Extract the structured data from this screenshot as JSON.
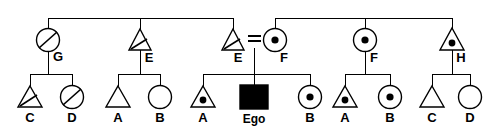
{
  "diagram": {
    "type": "pedigree",
    "width": 498,
    "height": 126,
    "colors": {
      "background": "#ffffff",
      "stroke": "#000000",
      "affected_fill": "#000000",
      "unaffected_fill": "#ffffff"
    },
    "legend_semantics": {
      "triangle": "male",
      "circle": "female",
      "square": "proband / ego",
      "center_dot": "carrier",
      "diagonal_slash": "deceased",
      "filled": "affected",
      "equals_sign": "mating / union"
    }
  },
  "generations": {
    "generation_1": {
      "name": "parental-generation",
      "sibships": [
        {
          "name": "sibship-left",
          "bar_y": 18,
          "bar_x_start": 48,
          "bar_x_end": 233,
          "members": [
            {
              "id": "g1-g",
              "label": "G",
              "shape": "circle",
              "sex": "female",
              "x": 48,
              "y": 40,
              "marker": "diagonal_slash",
              "affected": false
            },
            {
              "id": "g1-e1",
              "label": "E",
              "shape": "triangle",
              "sex": "male",
              "x": 140,
              "y": 40,
              "marker": "diagonal_slash",
              "affected": false
            },
            {
              "id": "g1-e2",
              "label": "E",
              "shape": "triangle",
              "sex": "male",
              "x": 233,
              "y": 40,
              "marker": "diagonal_slash",
              "affected": false
            }
          ]
        },
        {
          "name": "sibship-right",
          "bar_y": 18,
          "bar_x_start": 275,
          "bar_x_end": 452,
          "members": [
            {
              "id": "g1-f1",
              "label": "F",
              "shape": "circle",
              "sex": "female",
              "x": 275,
              "y": 40,
              "marker": "center_dot",
              "affected": false
            },
            {
              "id": "g1-f2",
              "label": "F",
              "shape": "circle",
              "sex": "female",
              "x": 365,
              "y": 40,
              "marker": "center_dot",
              "affected": false
            },
            {
              "id": "g1-h",
              "label": "H",
              "shape": "triangle",
              "sex": "male",
              "x": 452,
              "y": 40,
              "marker": "center_dot",
              "affected": false
            }
          ]
        }
      ],
      "mating": {
        "name": "mating-E-F",
        "label": "=",
        "left_parent": "g1-e2",
        "right_parent": "g1-f1",
        "x": 254,
        "y": 38
      }
    },
    "generation_2": {
      "name": "offspring-generation",
      "sibships": [
        {
          "name": "sibship-G-children",
          "parent": "g1-g",
          "bar_y": 74,
          "bar_x_start": 30,
          "bar_x_end": 72,
          "drop_x": 48,
          "members": [
            {
              "id": "g2-c1",
              "label": "C",
              "shape": "triangle",
              "sex": "male",
              "x": 30,
              "y": 97,
              "marker": "diagonal_slash",
              "affected": false
            },
            {
              "id": "g2-d1",
              "label": "D",
              "shape": "circle",
              "sex": "female",
              "x": 72,
              "y": 97,
              "marker": "diagonal_slash",
              "affected": false
            }
          ]
        },
        {
          "name": "sibship-E1-children",
          "parent": "g1-e1",
          "bar_y": 74,
          "bar_x_start": 118,
          "bar_x_end": 160,
          "drop_x": 140,
          "members": [
            {
              "id": "g2-a1",
              "label": "A",
              "shape": "triangle",
              "sex": "male",
              "x": 118,
              "y": 97,
              "marker": "none",
              "affected": false
            },
            {
              "id": "g2-b1",
              "label": "B",
              "shape": "circle",
              "sex": "female",
              "x": 160,
              "y": 97,
              "marker": "none",
              "affected": false
            }
          ]
        },
        {
          "name": "sibship-EF-children",
          "parent": "mating-E-F",
          "bar_y": 74,
          "bar_x_start": 203,
          "bar_x_end": 310,
          "drop_x": 254,
          "members": [
            {
              "id": "g2-a2",
              "label": "A",
              "shape": "triangle",
              "sex": "male",
              "x": 203,
              "y": 97,
              "marker": "center_dot",
              "affected": false
            },
            {
              "id": "g2-ego",
              "label": "Ego",
              "shape": "square",
              "sex": "male",
              "x": 254,
              "y": 97,
              "marker": "none",
              "affected": true
            },
            {
              "id": "g2-b2",
              "label": "B",
              "shape": "circle",
              "sex": "female",
              "x": 310,
              "y": 97,
              "marker": "center_dot",
              "affected": false
            }
          ]
        },
        {
          "name": "sibship-F2-children",
          "parent": "g1-f2",
          "bar_y": 74,
          "bar_x_start": 345,
          "bar_x_end": 390,
          "drop_x": 365,
          "members": [
            {
              "id": "g2-a3",
              "label": "A",
              "shape": "triangle",
              "sex": "male",
              "x": 345,
              "y": 97,
              "marker": "center_dot",
              "affected": false
            },
            {
              "id": "g2-b3",
              "label": "B",
              "shape": "circle",
              "sex": "female",
              "x": 390,
              "y": 97,
              "marker": "center_dot",
              "affected": false
            }
          ]
        },
        {
          "name": "sibship-H-children",
          "parent": "g1-h",
          "bar_y": 74,
          "bar_x_start": 432,
          "bar_x_end": 470,
          "drop_x": 452,
          "members": [
            {
              "id": "g2-c2",
              "label": "C",
              "shape": "triangle",
              "sex": "male",
              "x": 432,
              "y": 97,
              "marker": "none",
              "affected": false
            },
            {
              "id": "g2-d2",
              "label": "D",
              "shape": "circle",
              "sex": "female",
              "x": 470,
              "y": 97,
              "marker": "none",
              "affected": false
            }
          ]
        }
      ]
    }
  }
}
